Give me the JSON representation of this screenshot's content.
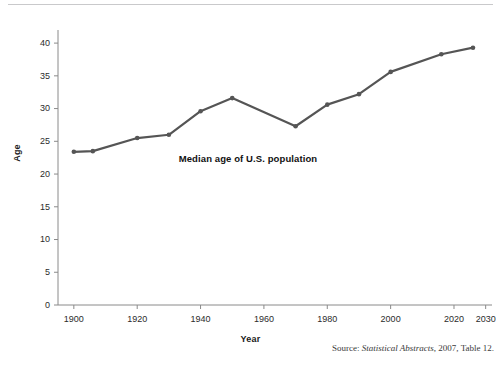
{
  "figure": {
    "source_note_prefix": "Source:",
    "source_note_italic_title": "Statistical Abstracts",
    "source_note_suffix": ", 2007, Table 12."
  },
  "chart_data": {
    "type": "line",
    "title": "Median age of U.S. population",
    "xlabel": "Year",
    "ylabel": "Age",
    "xlim": [
      1895,
      2032
    ],
    "ylim": [
      0,
      42
    ],
    "grid": false,
    "legend": "none",
    "line_color": "#555555",
    "marker": "circle",
    "marker_color": "#555555",
    "axis_color": "#8a8a8a",
    "xticks": [
      1900,
      1920,
      1940,
      1960,
      1980,
      2000,
      2020,
      2030
    ],
    "xtick_labels": [
      "1900",
      "1920",
      "1940",
      "1960",
      "1980",
      "2000",
      "2020",
      "2030"
    ],
    "yticks": [
      0,
      5,
      10,
      15,
      20,
      25,
      30,
      35,
      40
    ],
    "ytick_labels": [
      "0",
      "5",
      "10",
      "15",
      "20",
      "25",
      "30",
      "35",
      "40"
    ],
    "series": [
      {
        "name": "Median age of U.S. population",
        "x": [
          1900,
          1906,
          1920,
          1930,
          1940,
          1950,
          1970,
          1980,
          1990,
          2000,
          2016,
          2026
        ],
        "values": [
          23.4,
          23.5,
          25.5,
          26.0,
          29.6,
          31.6,
          27.3,
          30.6,
          32.2,
          35.6,
          38.3,
          39.3
        ]
      }
    ]
  }
}
